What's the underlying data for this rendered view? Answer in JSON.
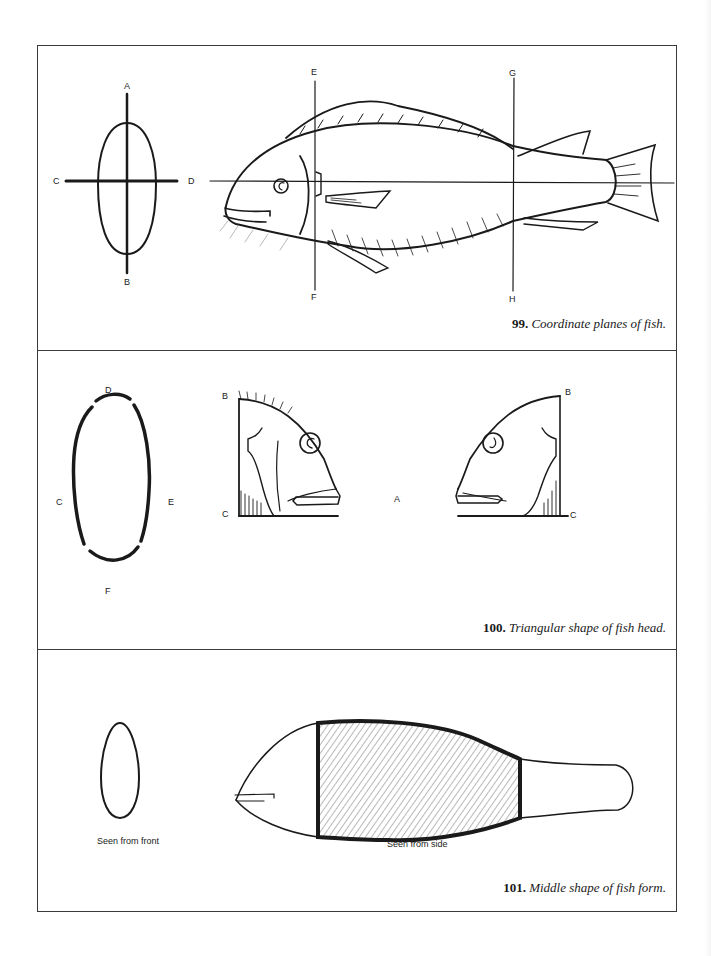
{
  "figures": [
    {
      "number": "99.",
      "caption": "Coordinate planes of fish.",
      "labels": {
        "A": "A",
        "B": "B",
        "C": "C",
        "D": "D",
        "E": "E",
        "F": "F",
        "G": "G",
        "H": "H"
      }
    },
    {
      "number": "100.",
      "caption": "Triangular shape of fish head.",
      "labels": {
        "D": "D",
        "C": "C",
        "E": "E",
        "F": "F",
        "B_left": "B",
        "C_left": "C",
        "A": "A",
        "B_right": "B",
        "C_right": "C"
      }
    },
    {
      "number": "101.",
      "caption": "Middle shape of fish form.",
      "sublabels": {
        "front": "Seen from front",
        "side": "Seen from side"
      }
    }
  ],
  "colors": {
    "ink": "#1a1a1a",
    "frame": "#3a3a3a",
    "paper": "#ffffff"
  }
}
